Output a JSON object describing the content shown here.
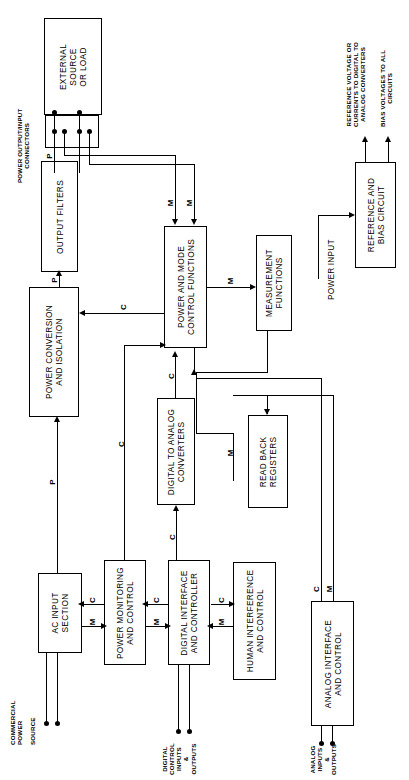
{
  "diagram": {
    "orientation": "rotated-90-ccw",
    "line_color": "#000000",
    "background": "#ffffff",
    "blocks": [
      {
        "id": "external-source-or-load",
        "label": [
          "EXTERNAL",
          "SOURCE",
          "OR LOAD"
        ]
      },
      {
        "id": "power-connectors",
        "label": []
      },
      {
        "id": "output-filters",
        "label": [
          "OUTPUT FILTERS"
        ]
      },
      {
        "id": "power-conversion-isolation",
        "label": [
          "POWER CONVERSION",
          "AND ISOLATION"
        ]
      },
      {
        "id": "power-mode-control",
        "label": [
          "POWER AND MODE",
          "CONTROL FUNCTIONS"
        ]
      },
      {
        "id": "measurement-functions",
        "label": [
          "MEASUREMENT",
          "FUNCTIONS"
        ]
      },
      {
        "id": "reference-bias-circuit",
        "label": [
          "REFERENCE AND",
          "BIAS CIRCUIT"
        ]
      },
      {
        "id": "ac-input-section",
        "label": [
          "AC INPUT",
          "SECTION"
        ]
      },
      {
        "id": "power-monitoring-control",
        "label": [
          "POWER MONITORING",
          "AND CONTROL"
        ]
      },
      {
        "id": "digital-interface-controller",
        "label": [
          "DIGITAL INTERFACE",
          "AND CONTROLLER"
        ]
      },
      {
        "id": "digital-to-analog-converters",
        "label": [
          "DIGITAL TO ANALOG",
          "CONVERTERS"
        ]
      },
      {
        "id": "read-back-registers",
        "label": [
          "READ BACK",
          "REGISTERS"
        ]
      },
      {
        "id": "human-interference-control",
        "label": [
          "HUMAN INTERFERENCE",
          "AND CONTROL"
        ]
      },
      {
        "id": "analog-interface-control",
        "label": [
          "ANALOG INTERFACE",
          "AND CONTROL"
        ]
      }
    ],
    "captions": [
      {
        "id": "power-output-input-connectors",
        "lines": [
          "POWER OUTPUT/INPUT",
          "CONNECTORS"
        ]
      },
      {
        "id": "commercial-power-source",
        "lines": [
          "COMMERCIAL",
          "POWER"
        ]
      },
      {
        "id": "source",
        "lines": [
          "SOURCE"
        ]
      },
      {
        "id": "digital-control-io",
        "lines": [
          "DIGITAL",
          "CONTROL",
          "INPUTS",
          "&",
          "OUTPUTS"
        ]
      },
      {
        "id": "analog-io",
        "lines": [
          "ANALOG",
          "INPUTS",
          "&",
          "OUTPUTS"
        ]
      },
      {
        "id": "power-input",
        "lines": [
          "POWER INPUT"
        ]
      },
      {
        "id": "reference-voltage-note",
        "lines": [
          "REFERENCE VOLTAGE OR",
          "CURRENTS TO DIGITAL TO",
          "ANALOG CONVERTERS"
        ]
      },
      {
        "id": "bias-voltages-note",
        "lines": [
          "BIAS VOLTAGES TO ALL",
          "CIRCUITS"
        ]
      }
    ],
    "signal_labels": {
      "power": "P",
      "measure": "M",
      "control": "C"
    },
    "signals": [
      {
        "id": "p-filters-to-connectors",
        "letter": "P"
      },
      {
        "id": "p-conversion-to-filters",
        "letter": "P"
      },
      {
        "id": "p-ac-input-to-conversion",
        "letter": "P"
      },
      {
        "id": "m-connector-to-pmc-1",
        "letter": "M"
      },
      {
        "id": "m-connector-to-pmc-2",
        "letter": "M"
      },
      {
        "id": "c-pmc-to-conversion",
        "letter": "C"
      },
      {
        "id": "c-dif-to-pmc",
        "letter": "C"
      },
      {
        "id": "m-pmc-to-measurement",
        "letter": "M"
      },
      {
        "id": "c-dac-to-pmc",
        "letter": "C"
      },
      {
        "id": "c-dif-to-dac",
        "letter": "C"
      },
      {
        "id": "m-measurement-to-readback",
        "letter": "M"
      },
      {
        "id": "m-ac-to-power-monitoring",
        "letter": "M"
      },
      {
        "id": "c-power-monitoring-to-ac",
        "letter": "C"
      },
      {
        "id": "m-power-monitoring-to-dif",
        "letter": "M"
      },
      {
        "id": "c-dif-to-power-monitoring",
        "letter": "C"
      },
      {
        "id": "c-pm-long-to-pmc",
        "letter": "C"
      },
      {
        "id": "m-human-to-dif",
        "letter": "M"
      },
      {
        "id": "c-dif-to-human",
        "letter": "C"
      },
      {
        "id": "c-analog-interface",
        "letter": "C"
      },
      {
        "id": "m-analog-interface",
        "letter": "M"
      }
    ]
  }
}
